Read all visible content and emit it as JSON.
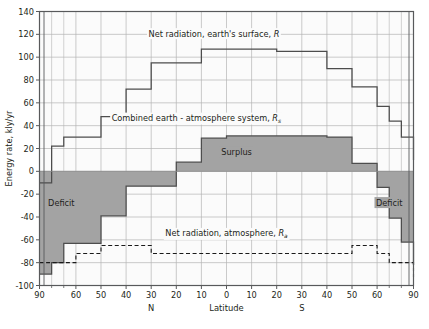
{
  "chart_data": {
    "type": "line",
    "title": "",
    "xlabel": "Latitude",
    "ylabel": "Energy rate, kly/yr",
    "ylim": [
      -100,
      140
    ],
    "ytick_step": 20,
    "yticks": [
      140,
      120,
      100,
      80,
      60,
      40,
      20,
      0,
      -20,
      -40,
      -60,
      -80,
      -100
    ],
    "ytick_labels": [
      "140",
      "120",
      "100",
      "80",
      "60",
      "40",
      "20",
      "0",
      "-20",
      "-40",
      "-60",
      "-80",
      "-100"
    ],
    "xticks_deg": [
      -90,
      -60,
      -50,
      -40,
      -30,
      -20,
      -10,
      0,
      10,
      20,
      30,
      40,
      50,
      60,
      90
    ],
    "xtick_labels": [
      "90",
      "60",
      "50",
      "40",
      "30",
      "20",
      "10",
      "0",
      "10",
      "20",
      "30",
      "40",
      "50",
      "60",
      "90"
    ],
    "hemisphere_labels": {
      "north": "N",
      "south": "S"
    },
    "grid": true,
    "legend_position": "inline-annotations",
    "series": [
      {
        "name": "Net radiation, earth's surface, R",
        "style": "step-solid",
        "band_edges_deg": [
          -90,
          -80,
          -70,
          -60,
          -50,
          -40,
          -30,
          -20,
          -10,
          0,
          10,
          20,
          30,
          40,
          50,
          60,
          70,
          80,
          90
        ],
        "values": [
          -10,
          22,
          30,
          30,
          48,
          72,
          95,
          95,
          107,
          107,
          107,
          105,
          105,
          90,
          74,
          57,
          44,
          30,
          10
        ]
      },
      {
        "name": "Combined earth - atmosphere system, Rs",
        "style": "step-solid-filled",
        "band_edges_deg": [
          -90,
          -80,
          -70,
          -60,
          -50,
          -40,
          -30,
          -20,
          -10,
          0,
          10,
          20,
          30,
          40,
          50,
          60,
          70,
          80,
          90
        ],
        "values": [
          -90,
          -80,
          -63,
          -63,
          -39,
          -13,
          -13,
          8,
          29,
          31,
          31,
          31,
          31,
          30,
          7,
          -14,
          -41,
          -62,
          -82
        ]
      },
      {
        "name": "Net radiation, atmosphere, Ra",
        "style": "step-dashed",
        "band_edges_deg": [
          -90,
          -80,
          -70,
          -60,
          -50,
          -40,
          -30,
          -20,
          -10,
          0,
          10,
          20,
          30,
          40,
          50,
          60,
          70,
          80,
          90
        ],
        "values": [
          -80,
          -80,
          -80,
          -72,
          -65,
          -65,
          -72,
          -72,
          -72,
          -72,
          -72,
          -72,
          -72,
          -72,
          -65,
          -72,
          -80,
          -80,
          -93
        ]
      }
    ],
    "annotations": [
      {
        "id": "annot-surface",
        "text": "Net radiation, earth's surface, ",
        "italic_tail": "R",
        "sub": "",
        "x_deg": -5,
        "y_val": 118
      },
      {
        "id": "annot-combined",
        "text": "Combined earth - atmosphere system, ",
        "italic_tail": "R",
        "sub": "s",
        "x_deg": -12,
        "y_val": 44
      },
      {
        "id": "annot-atmos",
        "text": "Net radiation, atmosphere, ",
        "italic_tail": "R",
        "sub": "a",
        "x_deg": 0,
        "y_val": -57
      },
      {
        "id": "annot-surplus",
        "text": "Surplus",
        "italic_tail": "",
        "sub": "",
        "x_deg": 4,
        "y_val": 14
      },
      {
        "id": "annot-deficit-n",
        "text": "Deficit",
        "italic_tail": "",
        "sub": "",
        "x_deg": -72,
        "y_val": -30
      },
      {
        "id": "annot-deficit-s",
        "text": "Deficit",
        "italic_tail": "",
        "sub": "",
        "x_deg": 70,
        "y_val": -30
      }
    ],
    "colors": {
      "line": "#4d4d4d",
      "fill": "#a3a3a3",
      "grid": "#b5b5b5",
      "frame": "#58595b",
      "text": "#231f20",
      "background": "#ffffff"
    }
  }
}
